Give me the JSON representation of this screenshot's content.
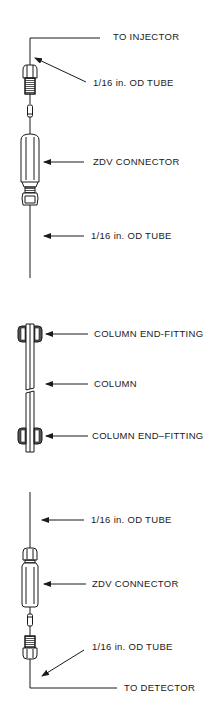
{
  "figure": {
    "line_color": "#1a1a1a",
    "background": "#ffffff"
  },
  "labels": {
    "to_injector": "TO INJECTOR",
    "tube_top_1": "1/16 in. OD TUBE",
    "zdv_top": "ZDV CONNECTOR",
    "tube_top_2": "1/16 in. OD TUBE",
    "end_fitting_top": "COLUMN END-FITTING",
    "column": "COLUMN",
    "end_fitting_bottom": "COLUMN END–FITTING",
    "tube_bottom_1": "1/16 in. OD TUBE",
    "zdv_bottom": "ZDV CONNECTOR",
    "tube_bottom_2": "1/16 in.  OD TUBE",
    "to_detector": "TO DETECTOR"
  },
  "sections": [
    {
      "name": "inlet-assembly",
      "parts": [
        "tube",
        "male nut",
        "ferrule",
        "ZDV connector",
        "tube"
      ]
    },
    {
      "name": "column-assembly",
      "parts": [
        "column end-fitting",
        "column",
        "column end-fitting"
      ]
    },
    {
      "name": "outlet-assembly",
      "parts": [
        "tube",
        "ZDV connector",
        "ferrule",
        "male nut",
        "tube"
      ]
    }
  ]
}
